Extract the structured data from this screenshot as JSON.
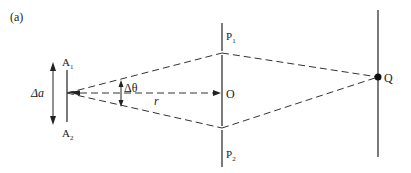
{
  "figure": {
    "panel_label": "(a)",
    "source": {
      "top_label": "A",
      "top_sub": "1",
      "bottom_label": "A",
      "bottom_sub": "2",
      "size_label": "Δa"
    },
    "slit_screen": {
      "top_label": "P",
      "top_sub": "1",
      "bottom_label": "P",
      "bottom_sub": "2",
      "center_label": "O"
    },
    "observation_point": {
      "label": "Q"
    },
    "angle_label": "Δθ",
    "distance_label": "r",
    "colors": {
      "line": "#333333",
      "dash": "#333333",
      "background": "#ffffff"
    }
  }
}
